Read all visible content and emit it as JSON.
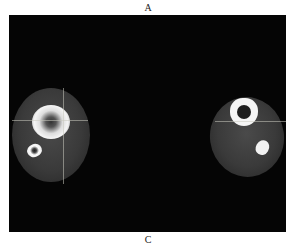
{
  "figure": {
    "label_top": "A",
    "label_bottom": "C",
    "panels": [
      {
        "side": "left",
        "structures": [
          "tibia",
          "fibula",
          "soft tissue"
        ],
        "crosshair": [
          "horizontal",
          "vertical"
        ]
      },
      {
        "side": "right",
        "structures": [
          "tibia",
          "fibula",
          "soft tissue"
        ],
        "crosshair": [
          "horizontal"
        ]
      }
    ],
    "colors": {
      "background": "#050505",
      "bone": "#f5f5f5",
      "soft_tissue": "#3a3a3a",
      "page": "#ffffff"
    }
  }
}
